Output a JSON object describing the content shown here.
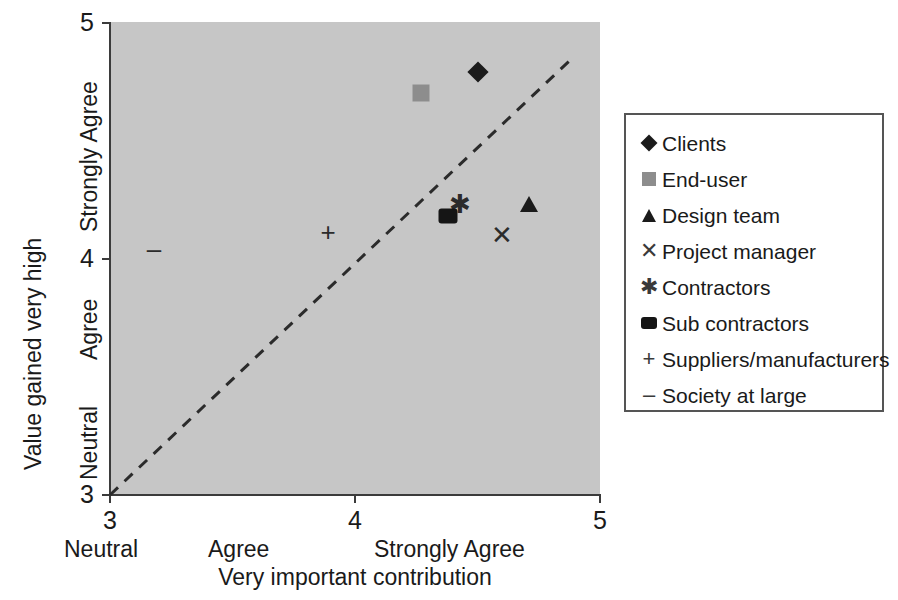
{
  "chart_data": {
    "type": "scatter",
    "title": "",
    "xlabel": "Very important contribution",
    "ylabel": "Value gained very high",
    "xlim": [
      3,
      5
    ],
    "ylim": [
      3,
      5
    ],
    "x_ticks": [
      "3",
      "4",
      "5"
    ],
    "y_ticks": [
      "3",
      "4",
      "5"
    ],
    "x_category_labels": [
      "Neutral",
      "Agree",
      "Strongly Agree"
    ],
    "y_category_labels": [
      "Neutral",
      "Agree",
      "Strongly Agree"
    ],
    "grid": false,
    "plot_background": "#c6c6c6",
    "legend_position": "right",
    "reference_line": {
      "style": "dashed",
      "from": [
        3,
        3
      ],
      "to": [
        4.89,
        4.85
      ]
    },
    "series": [
      {
        "name": "Clients",
        "marker": "diamond",
        "color": "#1b1b1b",
        "x": 4.5,
        "y": 4.79
      },
      {
        "name": "End-user",
        "marker": "square",
        "color": "#8d8d8d",
        "x": 4.27,
        "y": 4.7
      },
      {
        "name": "Design team",
        "marker": "triangle",
        "color": "#1b1b1b",
        "x": 4.71,
        "y": 4.23
      },
      {
        "name": "Project manager",
        "marker": "x",
        "color": "#2b2b2b",
        "x": 4.6,
        "y": 4.1
      },
      {
        "name": "Contractors",
        "marker": "asterisk",
        "color": "#2b2b2b",
        "x": 4.43,
        "y": 4.23
      },
      {
        "name": "Sub contractors",
        "marker": "blob",
        "color": "#151515",
        "x": 4.38,
        "y": 4.18
      },
      {
        "name": "Suppliers/manufacturers",
        "marker": "plus",
        "color": "#2b2b2b",
        "x": 3.89,
        "y": 4.11
      },
      {
        "name": "Society at large",
        "marker": "dash",
        "color": "#2b2b2b",
        "x": 3.18,
        "y": 4.04
      }
    ]
  },
  "legend": {
    "items": [
      {
        "label": "Clients",
        "glyph": "",
        "key": "diamond"
      },
      {
        "label": "End-user",
        "glyph": "",
        "key": "square"
      },
      {
        "label": "Design team",
        "glyph": "",
        "key": "triangle"
      },
      {
        "label": "Project manager",
        "glyph": "✕",
        "key": "glyph"
      },
      {
        "label": "Contractors",
        "glyph": "✱",
        "key": "glyph"
      },
      {
        "label": "Sub contractors",
        "glyph": "",
        "key": "blob"
      },
      {
        "label": "Suppliers/manufacturers",
        "glyph": "+",
        "key": "glyph"
      },
      {
        "label": "Society at large",
        "glyph": "–",
        "key": "glyph"
      }
    ]
  }
}
